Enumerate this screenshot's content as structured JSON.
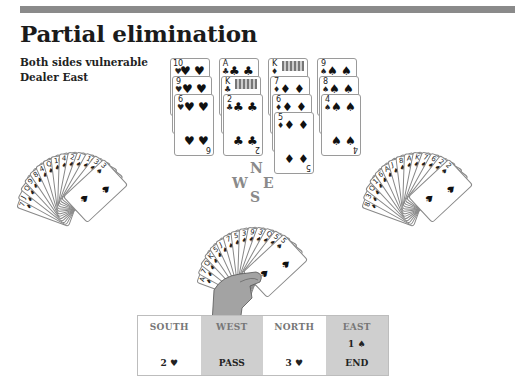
{
  "header": {
    "title": "Partial elimination",
    "vulnerability": "Both sides vulnerable",
    "dealer": "Dealer East"
  },
  "dummy": {
    "position": "North",
    "columns": [
      {
        "suit": "hearts",
        "symbol": "♥",
        "cards": [
          "10",
          "9",
          "6"
        ]
      },
      {
        "suit": "clubs",
        "symbol": "♣",
        "cards": [
          "A",
          "K",
          "2"
        ]
      },
      {
        "suit": "diamonds",
        "symbol": "♦",
        "cards": [
          "K",
          "7",
          "6",
          "5"
        ]
      },
      {
        "suit": "spades",
        "symbol": "♠",
        "cards": [
          "9",
          "8",
          "4"
        ]
      }
    ]
  },
  "compass": {
    "north": "N",
    "west": "W",
    "east": "E",
    "south": "S"
  },
  "west_hand": {
    "face_down_fan": true,
    "visible_ranks": [
      "7",
      "J",
      "Q",
      "9",
      "8",
      "4",
      "Q",
      "10",
      "4",
      "2",
      "J",
      "10",
      "3"
    ],
    "top_card": {
      "rank": "3",
      "suit": "♠"
    }
  },
  "east_hand": {
    "face_down_fan": true,
    "visible_ranks": [
      "8",
      "3",
      "Q",
      "10",
      "6",
      "A",
      "J",
      "8",
      "A",
      "K",
      "7",
      "6",
      "2"
    ],
    "top_card": {
      "rank": "2",
      "suit": "♠"
    }
  },
  "south_hand": {
    "visible_ranks": [
      "A",
      "7",
      "Q",
      "K",
      "5",
      "J",
      "7",
      "5",
      "3",
      "9",
      "3",
      "Q",
      "5"
    ],
    "top_card": {
      "rank": "5",
      "suit": "♠"
    }
  },
  "auction": {
    "columns": [
      {
        "seat": "SOUTH",
        "bids": [
          "",
          "2 ♥"
        ]
      },
      {
        "seat": "WEST",
        "bids": [
          "",
          "PASS"
        ]
      },
      {
        "seat": "NORTH",
        "bids": [
          "",
          "3 ♥"
        ]
      },
      {
        "seat": "EAST",
        "bids": [
          "1 ♠",
          "END"
        ]
      }
    ]
  },
  "colors": {
    "top_bar": "#8a8a8a",
    "auction_shade": "#cfcfcf",
    "hand_skin": "#a3a3a3"
  }
}
